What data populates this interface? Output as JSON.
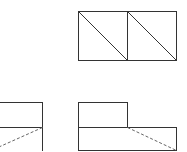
{
  "diagram": {
    "type": "orthographic-projection",
    "views": {
      "top": {
        "outer": {
          "x": 78,
          "y": 11,
          "w": 98,
          "h": 49
        },
        "divider_x": 127,
        "diagonals": [
          {
            "x1": 78,
            "y1": 11,
            "x2": 127,
            "y2": 60
          },
          {
            "x1": 127,
            "y1": 11,
            "x2": 176,
            "y2": 60
          }
        ]
      },
      "front": {
        "upper_block": {
          "x": 78,
          "y": 102,
          "w": 49,
          "h": 25
        },
        "lower_block": {
          "x": 78,
          "y": 127,
          "w": 98,
          "h": 23
        },
        "hidden_line": {
          "x1": 127,
          "y1": 127,
          "x2": 176,
          "y2": 150
        }
      },
      "side": {
        "upper_block": {
          "x": -10,
          "y": 102,
          "w": 52,
          "h": 25
        },
        "lower_block": {
          "x": -10,
          "y": 127,
          "w": 52,
          "h": 30
        },
        "hidden_line": {
          "x1": 42,
          "y1": 127,
          "x2": 0,
          "y2": 146
        }
      }
    },
    "colors": {
      "line": "#333333",
      "hidden": "#666666",
      "background": "#ffffff"
    }
  }
}
